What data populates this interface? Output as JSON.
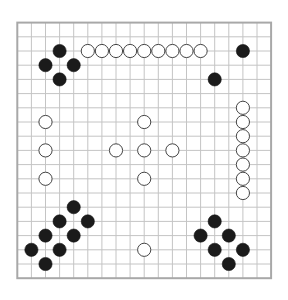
{
  "board": {
    "size": 19,
    "origin_x": 17.3,
    "origin_y": 22.6,
    "step_x": 14.1,
    "step_y": 14.2,
    "stone_radius": 6.6,
    "colors": {
      "background": "#ffffff",
      "grid": "#c4c4c4",
      "border": "#a8a8a8",
      "black_stone": "#1b1b1b",
      "white_stone": "#ffffff",
      "white_outline": "#444444"
    }
  },
  "stones": {
    "black": [
      [
        3,
        2
      ],
      [
        2,
        3
      ],
      [
        4,
        3
      ],
      [
        3,
        4
      ],
      [
        16,
        2
      ],
      [
        14,
        4
      ],
      [
        4,
        13
      ],
      [
        3,
        14
      ],
      [
        5,
        14
      ],
      [
        2,
        15
      ],
      [
        4,
        15
      ],
      [
        1,
        16
      ],
      [
        3,
        16
      ],
      [
        2,
        17
      ],
      [
        14,
        14
      ],
      [
        13,
        15
      ],
      [
        15,
        15
      ],
      [
        14,
        16
      ],
      [
        16,
        16
      ],
      [
        15,
        17
      ]
    ],
    "white": [
      [
        5,
        2
      ],
      [
        6,
        2
      ],
      [
        7,
        2
      ],
      [
        8,
        2
      ],
      [
        9,
        2
      ],
      [
        10,
        2
      ],
      [
        11,
        2
      ],
      [
        12,
        2
      ],
      [
        13,
        2
      ],
      [
        16,
        6
      ],
      [
        16,
        7
      ],
      [
        16,
        8
      ],
      [
        16,
        9
      ],
      [
        16,
        10
      ],
      [
        16,
        11
      ],
      [
        16,
        12
      ],
      [
        2,
        7
      ],
      [
        2,
        9
      ],
      [
        2,
        11
      ],
      [
        9,
        7
      ],
      [
        7,
        9
      ],
      [
        9,
        9
      ],
      [
        11,
        9
      ],
      [
        9,
        11
      ],
      [
        9,
        16
      ]
    ]
  }
}
